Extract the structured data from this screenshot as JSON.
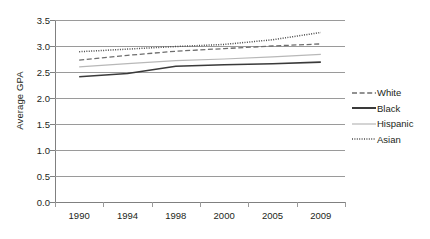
{
  "chart_data": {
    "type": "line",
    "title": "",
    "xlabel": "",
    "ylabel": "Average GPA",
    "categories": [
      "1990",
      "1994",
      "1998",
      "2000",
      "2005",
      "2009"
    ],
    "ylim": [
      0.0,
      3.5
    ],
    "y_ticks": [
      "0.0",
      "0.5",
      "1.0",
      "1.5",
      "2.0",
      "2.5",
      "3.0",
      "3.5"
    ],
    "y_tick_values": [
      0.0,
      0.5,
      1.0,
      1.5,
      2.0,
      2.5,
      3.0,
      3.5
    ],
    "grid": true,
    "legend_position": "right",
    "series": [
      {
        "name": "White",
        "style": "dashed",
        "color": "#6e6e6e",
        "values": [
          2.73,
          2.82,
          2.9,
          2.95,
          3.0,
          3.04
        ]
      },
      {
        "name": "Black",
        "style": "solid",
        "color": "#3a3a3a",
        "values": [
          2.41,
          2.47,
          2.61,
          2.64,
          2.66,
          2.69
        ]
      },
      {
        "name": "Hispanic",
        "style": "solid-light",
        "color": "#b8b8b8",
        "values": [
          2.6,
          2.66,
          2.72,
          2.75,
          2.79,
          2.84
        ]
      },
      {
        "name": "Asian",
        "style": "dotted",
        "color": "#4a4a4a",
        "values": [
          2.89,
          2.94,
          2.99,
          3.03,
          3.12,
          3.26
        ]
      }
    ]
  },
  "legend": {
    "items": [
      {
        "label": "White"
      },
      {
        "label": "Black"
      },
      {
        "label": "Hispanic"
      },
      {
        "label": "Asian"
      }
    ]
  }
}
